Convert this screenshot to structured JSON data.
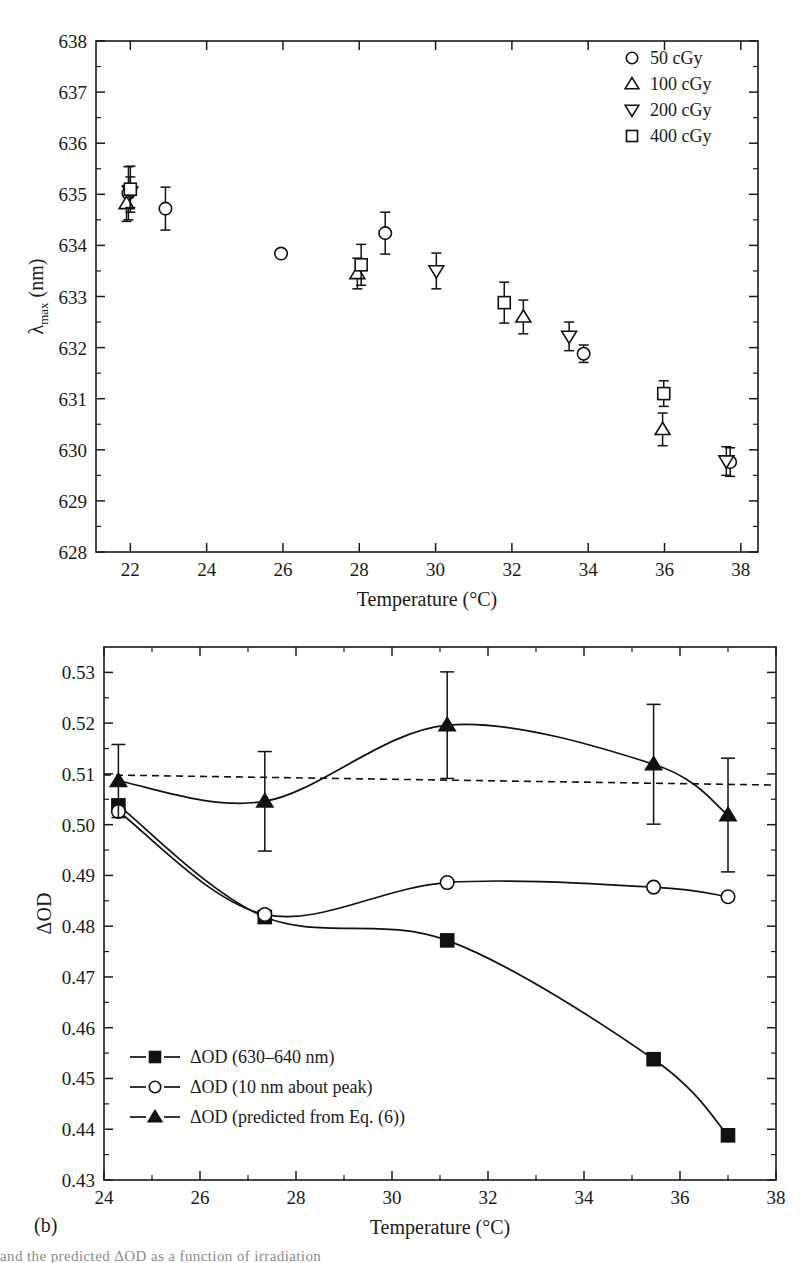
{
  "figure": {
    "panel_label_b": "(b)",
    "caption_fragment": "and the predicted ΔOD as a function of irradiation"
  },
  "chart_data": [
    {
      "id": "panel-a",
      "type": "scatter",
      "title": "",
      "xlabel": "Temperature (°C)",
      "ylabel": "λmax (nm)",
      "ylabel_parts": {
        "lambda": "λ",
        "sub": "max",
        "unit": " (nm)"
      },
      "xlim": [
        21.1,
        38.45
      ],
      "ylim": [
        628,
        638
      ],
      "xticks": [
        22,
        24,
        26,
        28,
        30,
        32,
        34,
        36,
        38
      ],
      "yticks": [
        628,
        629,
        630,
        631,
        632,
        633,
        634,
        635,
        636,
        637,
        638
      ],
      "xtick_labels": [
        "22",
        "24",
        "26",
        "28",
        "30",
        "32",
        "34",
        "36",
        "38"
      ],
      "ytick_labels": [
        "628",
        "629",
        "630",
        "631",
        "632",
        "633",
        "634",
        "635",
        "636",
        "637",
        "638"
      ],
      "minor_tick_step_x": 1,
      "minor_tick_step_y": 0.5,
      "grid": false,
      "legend_position": "top-right",
      "error_bars": true,
      "series": [
        {
          "name": "50 cGy",
          "marker": "circle",
          "points": [
            {
              "x": 21.95,
              "y": 635.02,
              "yerr": 0.52
            },
            {
              "x": 22.92,
              "y": 634.72,
              "yerr": 0.42
            },
            {
              "x": 25.95,
              "y": 633.84,
              "yerr": 0.0
            },
            {
              "x": 28.68,
              "y": 634.24,
              "yerr": 0.41
            },
            {
              "x": 33.88,
              "y": 631.88,
              "yerr": 0.17
            },
            {
              "x": 37.72,
              "y": 629.76,
              "yerr": 0.28
            }
          ]
        },
        {
          "name": "100 cGy",
          "marker": "triangle-up",
          "points": [
            {
              "x": 21.9,
              "y": 634.82,
              "yerr": 0.35
            },
            {
              "x": 27.95,
              "y": 633.45,
              "yerr": 0.3
            },
            {
              "x": 32.3,
              "y": 632.6,
              "yerr": 0.33
            },
            {
              "x": 35.95,
              "y": 630.4,
              "yerr": 0.32
            }
          ]
        },
        {
          "name": "200 cGy",
          "marker": "triangle-down",
          "points": [
            {
              "x": 22.0,
              "y": 635.04,
              "yerr": 0.3
            },
            {
              "x": 30.02,
              "y": 633.5,
              "yerr": 0.35
            },
            {
              "x": 33.5,
              "y": 632.22,
              "yerr": 0.28
            },
            {
              "x": 37.62,
              "y": 629.78,
              "yerr": 0.28
            }
          ]
        },
        {
          "name": "400 cGy",
          "marker": "square",
          "points": [
            {
              "x": 22.0,
              "y": 635.1,
              "yerr": 0.45
            },
            {
              "x": 28.05,
              "y": 633.62,
              "yerr": 0.4
            },
            {
              "x": 31.8,
              "y": 632.88,
              "yerr": 0.4
            },
            {
              "x": 35.98,
              "y": 631.1,
              "yerr": 0.25
            }
          ]
        }
      ]
    },
    {
      "id": "panel-b",
      "type": "line",
      "title": "",
      "xlabel": "Temperature (°C)",
      "ylabel": "ΔOD",
      "xlim": [
        24,
        38
      ],
      "ylim": [
        0.43,
        0.535
      ],
      "xticks": [
        24,
        26,
        28,
        30,
        32,
        34,
        36,
        38
      ],
      "yticks": [
        0.43,
        0.44,
        0.45,
        0.46,
        0.47,
        0.48,
        0.49,
        0.5,
        0.51,
        0.52,
        0.53
      ],
      "xtick_labels": [
        "24",
        "26",
        "28",
        "30",
        "32",
        "34",
        "36",
        "38"
      ],
      "ytick_labels": [
        "0.43",
        "0.44",
        "0.45",
        "0.46",
        "0.47",
        "0.48",
        "0.49",
        "0.50",
        "0.51",
        "0.52",
        "0.53"
      ],
      "minor_tick_step_x": 1,
      "minor_tick_step_y": 0.005,
      "grid": false,
      "legend_position": "bottom-left",
      "reference_line": {
        "style": "dashed",
        "y_start": 0.5098,
        "y_end": 0.5078,
        "label": ""
      },
      "series": [
        {
          "name": "ΔOD (630–640 nm)",
          "marker": "square-filled",
          "legend_text": "ΔOD (630–640 nm)",
          "points": [
            {
              "x": 24.3,
              "y": 0.5038
            },
            {
              "x": 27.35,
              "y": 0.4818
            },
            {
              "x": 31.15,
              "y": 0.4772
            },
            {
              "x": 35.45,
              "y": 0.4538
            },
            {
              "x": 37.0,
              "y": 0.4388
            }
          ]
        },
        {
          "name": "ΔOD (10 nm about peak)",
          "marker": "circle-open",
          "legend_text": "ΔOD (10 nm about peak)",
          "points": [
            {
              "x": 24.3,
              "y": 0.5026
            },
            {
              "x": 27.35,
              "y": 0.4823
            },
            {
              "x": 31.15,
              "y": 0.4886
            },
            {
              "x": 35.45,
              "y": 0.4877
            },
            {
              "x": 37.0,
              "y": 0.4858
            }
          ]
        },
        {
          "name": "ΔOD (predicted from Eq. (6))",
          "marker": "triangle-filled",
          "legend_text": "ΔOD (predicted from Eq. (6))",
          "points": [
            {
              "x": 24.3,
              "y": 0.5086,
              "yerr": 0.0072
            },
            {
              "x": 27.35,
              "y": 0.5046,
              "yerr": 0.0098
            },
            {
              "x": 31.15,
              "y": 0.5196,
              "yerr": 0.0105
            },
            {
              "x": 35.45,
              "y": 0.5119,
              "yerr": 0.0118
            },
            {
              "x": 37.0,
              "y": 0.5019,
              "yerr": 0.0112
            }
          ]
        }
      ]
    }
  ]
}
